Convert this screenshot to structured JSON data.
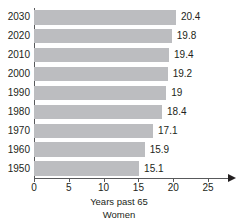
{
  "chart_data": {
    "type": "bar",
    "orientation": "horizontal",
    "title": "",
    "subtitle": "",
    "xlabel": "Years past 65",
    "ylabel": "",
    "series_caption": "Women",
    "categories": [
      "2030",
      "2020",
      "2010",
      "2000",
      "1990",
      "1980",
      "1970",
      "1960",
      "1950"
    ],
    "values": [
      20.4,
      19.8,
      19.4,
      19.2,
      19,
      18.4,
      17.1,
      15.9,
      15.1
    ],
    "value_labels": [
      "20.4",
      "19.8",
      "19.4",
      "19.2",
      "19",
      "18.4",
      "17.1",
      "15.9",
      "15.1"
    ],
    "series": [
      {
        "name": "Women",
        "values": [
          20.4,
          19.8,
          19.4,
          19.2,
          19,
          18.4,
          17.1,
          15.9,
          15.1
        ]
      }
    ],
    "xlim": [
      0,
      25
    ],
    "xticks": [
      0,
      5,
      10,
      15,
      20,
      25
    ],
    "xtick_labels": [
      "0",
      "5",
      "10",
      "15",
      "20",
      "25"
    ],
    "grid": false,
    "legend": "none",
    "bar_color": "#bcbdc0",
    "axis_color": "#58595b",
    "text_color": "#231f20",
    "background_color": "#ffffff",
    "x_axis_has_arrow": true
  },
  "icons": {
    "x_axis_arrow": "arrow-right-icon"
  }
}
